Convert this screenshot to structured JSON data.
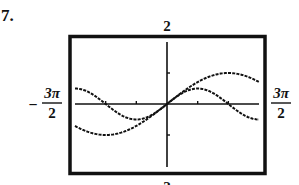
{
  "problem_number": "7.",
  "window": {
    "ymax_label": "2",
    "ymin_label": "-2",
    "xmin_label": {
      "sign": "−",
      "numerator": "3π",
      "denominator": "2"
    },
    "xmax_label": {
      "numerator": "3π",
      "denominator": "2"
    }
  },
  "chart_data": {
    "type": "line",
    "title": "",
    "xlabel": "",
    "ylabel": "",
    "xlim": [
      -4.712,
      4.712
    ],
    "ylim": [
      -2,
      2
    ],
    "x_tick_labels": [
      "-3π/2",
      "3π/2"
    ],
    "y_tick_labels": [
      "-2",
      "2"
    ],
    "x_ticks": [
      -3.1416,
      -1.5708,
      1.5708,
      3.1416
    ],
    "y_ticks": [
      -1,
      1
    ],
    "grid": false,
    "frame": "thick black border (graphing calculator window)",
    "series": [
      {
        "name": "curve-a",
        "formula": "y = sin(x/2)",
        "style": "dotted",
        "x": [
          -4.712,
          -3.142,
          -1.571,
          0,
          1.571,
          3.142,
          4.712
        ],
        "y": [
          -0.707,
          -1.0,
          -0.707,
          0,
          0.707,
          1.0,
          0.707
        ]
      },
      {
        "name": "curve-b",
        "formula": "y = 0.5 sin(x)",
        "style": "dotted",
        "x": [
          -4.712,
          -3.142,
          -1.571,
          0,
          1.571,
          3.142,
          4.712
        ],
        "y": [
          0.5,
          0,
          -0.5,
          0,
          0.5,
          0,
          -0.5
        ]
      }
    ]
  }
}
